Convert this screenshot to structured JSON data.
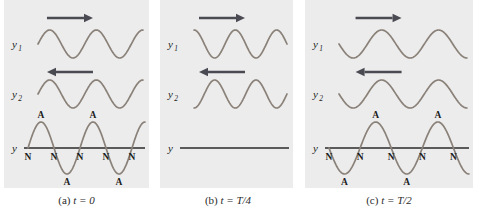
{
  "figure": {
    "background_color": "#ffffff",
    "panel_background": "#ececed",
    "wave_color": "#8a8178",
    "axis_color": "#5a5a5a",
    "arrow_color": "#4a4a52",
    "text_color": "#1c1c1c"
  },
  "panels": [
    {
      "id": "panel-a",
      "caption_prefix": "(a)",
      "caption_var": "t",
      "caption_eq": "= 0",
      "caption_full": "(a) t = 0",
      "time_label": "t = 0",
      "waves": [
        {
          "name": "y1",
          "label": "y",
          "subscript": "1",
          "direction": "right",
          "arrow_glyph": "right-arrow",
          "phase_deg": 0,
          "amplitude": 14,
          "cycles": 2.25
        },
        {
          "name": "y2",
          "label": "y",
          "subscript": "2",
          "direction": "left",
          "arrow_glyph": "left-arrow",
          "phase_deg": 0,
          "amplitude": 14,
          "cycles": 2.25
        }
      ],
      "resultant": {
        "name": "y",
        "label": "y",
        "subscript": "",
        "type": "standing-wave",
        "amplitude": 26,
        "cycles": 2.25,
        "inverted": false,
        "flat": false,
        "node_label": "N",
        "antinode_label": "A",
        "nodes": [
          "N",
          "N",
          "N",
          "N",
          "N"
        ],
        "antinodes": [
          "A",
          "A",
          "A",
          "A"
        ],
        "antinode_positions": [
          "up",
          "down",
          "up",
          "down"
        ]
      }
    },
    {
      "id": "panel-b",
      "caption_prefix": "(b)",
      "caption_var": "t",
      "caption_eq": "= T/4",
      "caption_full": "(b) t = T/4",
      "time_label": "t = T/4",
      "waves": [
        {
          "name": "y1",
          "label": "y",
          "subscript": "1",
          "direction": "right",
          "arrow_glyph": "right-arrow",
          "phase_deg": 90,
          "amplitude": 14,
          "cycles": 2.25
        },
        {
          "name": "y2",
          "label": "y",
          "subscript": "2",
          "direction": "left",
          "arrow_glyph": "left-arrow",
          "phase_deg": 270,
          "amplitude": 14,
          "cycles": 2.25
        }
      ],
      "resultant": {
        "name": "y",
        "label": "y",
        "subscript": "",
        "type": "flat-line",
        "amplitude": 0,
        "cycles": 0,
        "inverted": false,
        "flat": true,
        "node_label": "",
        "antinode_label": "",
        "nodes": [],
        "antinodes": [],
        "antinode_positions": []
      }
    },
    {
      "id": "panel-c",
      "caption_prefix": "(c)",
      "caption_var": "t",
      "caption_eq": "= T/2",
      "caption_full": "(c) t = T/2",
      "time_label": "t = T/2",
      "waves": [
        {
          "name": "y1",
          "label": "y",
          "subscript": "1",
          "direction": "right",
          "arrow_glyph": "right-arrow",
          "phase_deg": 180,
          "amplitude": 14,
          "cycles": 2.25
        },
        {
          "name": "y2",
          "label": "y",
          "subscript": "2",
          "direction": "left",
          "arrow_glyph": "left-arrow",
          "phase_deg": 180,
          "amplitude": 14,
          "cycles": 2.25
        }
      ],
      "resultant": {
        "name": "y",
        "label": "y",
        "subscript": "",
        "type": "standing-wave",
        "amplitude": 26,
        "cycles": 2.25,
        "inverted": true,
        "flat": false,
        "node_label": "N",
        "antinode_label": "A",
        "nodes": [
          "N",
          "N",
          "N",
          "N",
          "N"
        ],
        "antinodes": [
          "A",
          "A",
          "A",
          "A"
        ],
        "antinode_positions": [
          "down",
          "up",
          "down",
          "up"
        ]
      }
    }
  ]
}
